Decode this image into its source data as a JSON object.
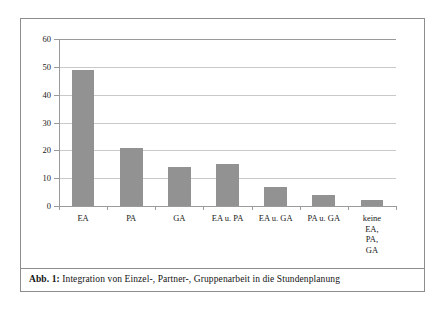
{
  "figure": {
    "caption_label": "Abb. 1:",
    "caption_text": " Integration von Einzel-, Partner-, Gruppenarbeit in die Stundenplanung"
  },
  "colors": {
    "bar_fill": "#929292",
    "gridline": "#c9c9c9",
    "axis": "#9a9a9a",
    "frame_border": "#8d8d8d",
    "background": "#ffffff"
  },
  "chart_data": {
    "type": "bar",
    "title": "",
    "xlabel": "",
    "ylabel": "",
    "categories": [
      "EA",
      "PA",
      "GA",
      "EA u. PA",
      "EA u. GA",
      "PA u. GA",
      "keine EA,\nPA, GA"
    ],
    "values": [
      49,
      21,
      14,
      15,
      7,
      4,
      2
    ],
    "ylim": [
      0,
      60
    ],
    "yticks": [
      0,
      10,
      20,
      30,
      40,
      50,
      60
    ],
    "ytick_labels": [
      "0",
      "10",
      "20",
      "30",
      "40",
      "50",
      "60"
    ],
    "grid": true,
    "legend": false
  }
}
